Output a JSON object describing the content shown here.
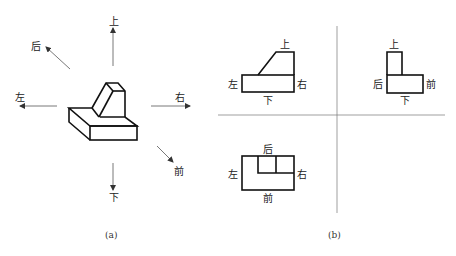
{
  "figure_a": {
    "caption": "(a)",
    "directions": {
      "up": "上",
      "down": "下",
      "left": "左",
      "right": "右",
      "back": "后",
      "front": "前"
    }
  },
  "figure_b": {
    "caption": "(b)",
    "front_view": {
      "top": "上",
      "bottom": "下",
      "left": "左",
      "right": "右"
    },
    "side_view": {
      "top": "上",
      "bottom": "下",
      "left": "后",
      "right": "前"
    },
    "top_view": {
      "top": "后",
      "bottom": "前",
      "left": "左",
      "right": "右"
    }
  },
  "colors": {
    "line": "#111111",
    "guide": "#777777",
    "background": "#ffffff"
  }
}
